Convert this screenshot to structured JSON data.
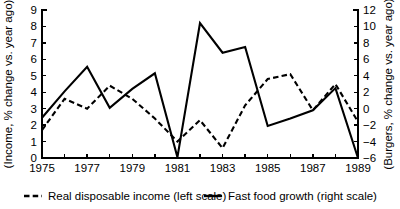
{
  "chart_data": {
    "type": "line",
    "title": "",
    "xlabel": "",
    "ylabel": "(Income, % change vs. year ago)",
    "y2label": "(Burgers, % change vs. year ago)",
    "grid": false,
    "legend_position": "bottom",
    "x": [
      1975,
      1976,
      1977,
      1978,
      1979,
      1980,
      1981,
      1982,
      1983,
      1984,
      1985,
      1986,
      1987,
      1988,
      1989
    ],
    "xlim": [
      1975,
      1989
    ],
    "xticks": [
      1975,
      1976,
      1977,
      1978,
      1979,
      1980,
      1981,
      1982,
      1983,
      1984,
      1985,
      1986,
      1987,
      1988,
      1989
    ],
    "xticklabels": [
      "1975",
      "",
      "1977",
      "",
      "1979",
      "",
      "1981",
      "",
      "1983",
      "",
      "1985",
      "",
      "1987",
      "",
      "1989"
    ],
    "ylim": [
      0,
      9
    ],
    "yticks": [
      0,
      1,
      2,
      3,
      4,
      5,
      6,
      7,
      8,
      9
    ],
    "yticklabels": [
      "0",
      "1",
      "2",
      "3",
      "4",
      "5",
      "6",
      "7",
      "8",
      "9"
    ],
    "y2lim": [
      -6,
      12
    ],
    "y2ticks": [
      -6,
      -4,
      -2,
      0,
      2,
      4,
      6,
      8,
      10,
      12
    ],
    "y2ticklabels": [
      "−6",
      "−4",
      "−2",
      "0",
      "2",
      "4",
      "6",
      "8",
      "10",
      "12"
    ],
    "series": [
      {
        "name": "Real disposable income (left scale)",
        "axis": "left",
        "style": "dashed",
        "color": "#000000",
        "values": [
          1.7,
          3.6,
          3.0,
          4.4,
          3.6,
          2.4,
          1.0,
          2.3,
          0.6,
          3.2,
          4.8,
          5.1,
          2.9,
          4.5,
          2.2
        ]
      },
      {
        "name": "Fast food growth (right scale)",
        "axis": "right",
        "style": "solid",
        "color": "#000000",
        "values": [
          -1.1,
          2.1,
          5.1,
          0.1,
          2.4,
          4.3,
          -5.9,
          10.4,
          6.8,
          7.5,
          -2.1,
          -1.2,
          -0.2,
          2.5,
          -6.0
        ]
      }
    ]
  },
  "legend": {
    "items": [
      {
        "label": "Real disposable income (left scale)",
        "style": "dashed"
      },
      {
        "label": "Fast food growth (right scale)",
        "style": "solid"
      }
    ]
  }
}
